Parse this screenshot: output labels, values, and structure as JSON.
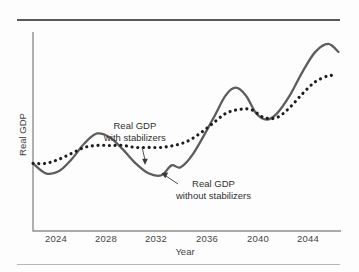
{
  "figure": {
    "background_color": "#fdfdfd",
    "rule_top_color": "#595959",
    "rule_bottom_color": "#b7b7b7"
  },
  "annotations": {
    "with_stabilizers": {
      "line1": "Real GDP",
      "line2": "with stabilizers"
    },
    "without_stabilizers": {
      "line1": "Real GDP",
      "line2": "without stabilizers"
    }
  },
  "chart_data": {
    "type": "line",
    "title": "",
    "xlabel": "Year",
    "ylabel": "Real GDP",
    "grid": false,
    "legend": "annotations-inline",
    "xlim": [
      2022,
      2046
    ],
    "ylim": [
      0,
      100
    ],
    "xticks": [
      "2024",
      "2028",
      "2032",
      "2036",
      "2040",
      "2044"
    ],
    "yticks": [],
    "axis_color": "#8e8e8e",
    "series": [
      {
        "name": "Real GDP without stabilizers",
        "style": "solid",
        "color": "#5d5d5d",
        "x": [
          2022.0,
          2023.0,
          2024.0,
          2025.0,
          2026.0,
          2027.0,
          2028.0,
          2029.0,
          2030.0,
          2031.0,
          2032.0,
          2032.8,
          2033.5,
          2034.5,
          2036.0,
          2037.0,
          2037.8,
          2038.6,
          2039.4,
          2040.2,
          2041.0,
          2042.0,
          2043.0,
          2044.0,
          2045.0,
          2045.8
        ],
        "y": [
          34,
          29,
          30,
          36,
          44,
          49,
          47,
          41,
          34,
          29,
          28,
          33,
          32,
          39,
          56,
          68,
          72,
          68,
          59,
          56,
          59,
          68,
          80,
          90,
          94,
          90
        ]
      },
      {
        "name": "Real GDP with stabilizers",
        "style": "dotted",
        "color": "#1d1d1d",
        "x": [
          2022.0,
          2023.0,
          2024.0,
          2025.0,
          2026.0,
          2027.0,
          2028.0,
          2029.0,
          2030.0,
          2031.0,
          2032.0,
          2033.0,
          2034.0,
          2035.0,
          2036.0,
          2037.0,
          2038.0,
          2039.0,
          2040.0,
          2041.0,
          2042.0,
          2043.0,
          2044.0,
          2045.0,
          2045.5
        ],
        "y": [
          34,
          34,
          36,
          39,
          42,
          43,
          43,
          43,
          42,
          42,
          42,
          43,
          45,
          49,
          54,
          59,
          61,
          61,
          57,
          57,
          62,
          69,
          75,
          78,
          78
        ]
      }
    ]
  }
}
